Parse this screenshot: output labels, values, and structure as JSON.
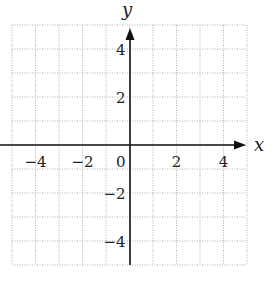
{
  "chart_data": {
    "type": "scatter",
    "title": "",
    "xlabel": "x",
    "ylabel": "y",
    "xlim": [
      -5,
      5
    ],
    "ylim": [
      -5,
      5
    ],
    "grid": true,
    "grid_style": "dotted",
    "grid_step": 1,
    "x_ticks": [
      -4,
      -2,
      0,
      2,
      4
    ],
    "x_tick_labels": [
      "−4",
      "−2",
      "0",
      "2",
      "4"
    ],
    "y_ticks": [
      4,
      2,
      -2,
      -4
    ],
    "y_tick_labels": [
      "4",
      "2",
      "−2",
      "−4"
    ],
    "series": [],
    "colors": {
      "axis": "#111111",
      "grid": "#b0b0b0",
      "text": "#222222"
    }
  }
}
